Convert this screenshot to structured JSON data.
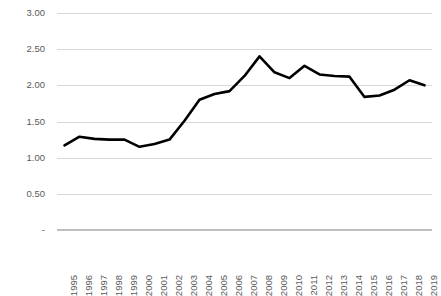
{
  "chart_data": {
    "type": "line",
    "title": "",
    "subtitle": "",
    "xlabel": "",
    "ylabel": "",
    "grid": true,
    "legend": false,
    "legend_position": "none",
    "line_color": "#000000",
    "gridline_color": "#D9D9D9",
    "tick_label_color": "#5A5A5A",
    "ylim": [
      0,
      3.0
    ],
    "y_ticks": [
      0,
      0.5,
      1.0,
      1.5,
      2.0,
      2.5,
      3.0
    ],
    "y_tick_labels": [
      "-",
      "0.50",
      "1.00",
      "1.50",
      "2.00",
      "2.50",
      "3.00"
    ],
    "categories": [
      "1995",
      "1996",
      "1997",
      "1998",
      "1999",
      "2000",
      "2001",
      "2002",
      "2003",
      "2004",
      "2005",
      "2006",
      "2007",
      "2008",
      "2009",
      "2010",
      "2011",
      "2012",
      "2013",
      "2014",
      "2015",
      "2016",
      "2017",
      "2018",
      "2019"
    ],
    "values": [
      1.17,
      1.29,
      1.26,
      1.25,
      1.25,
      1.15,
      1.19,
      1.25,
      1.51,
      1.8,
      1.88,
      1.92,
      2.13,
      2.4,
      2.18,
      2.1,
      2.27,
      2.15,
      2.13,
      2.12,
      1.84,
      1.86,
      1.94,
      2.07,
      2.0
    ]
  }
}
